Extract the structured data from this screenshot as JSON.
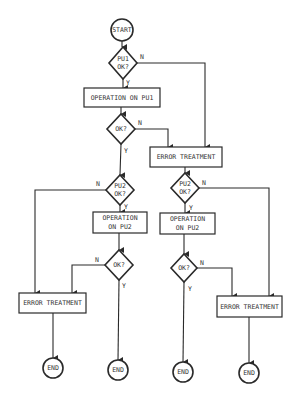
{
  "diagram": {
    "type": "flowchart",
    "nodes": {
      "start": {
        "label": "START"
      },
      "pu1_ok": {
        "line1": "PU1",
        "line2": "OK?"
      },
      "op_pu1": {
        "label": "OPERATION ON PU1"
      },
      "ok1": {
        "label": "OK?"
      },
      "err1": {
        "label": "ERROR TREATMENT"
      },
      "pu2_ok_left": {
        "line1": "PU2",
        "line2": "OK?"
      },
      "op_pu2_left": {
        "line1": "OPERATION",
        "line2": "ON PU2"
      },
      "ok_left": {
        "label": "OK?"
      },
      "err_left": {
        "label": "ERROR TREATMENT"
      },
      "end1": {
        "label": "END"
      },
      "end2": {
        "label": "END"
      },
      "pu2_ok_right": {
        "line1": "PU2",
        "line2": "OK?"
      },
      "op_pu2_right": {
        "line1": "OPERATION",
        "line2": "ON PU2"
      },
      "ok_right": {
        "label": "OK?"
      },
      "err_right": {
        "label": "ERROR TREATMENT"
      },
      "end3": {
        "label": "END"
      },
      "end4": {
        "label": "END"
      }
    },
    "edge_labels": {
      "yes": "Y",
      "no": "N"
    }
  }
}
